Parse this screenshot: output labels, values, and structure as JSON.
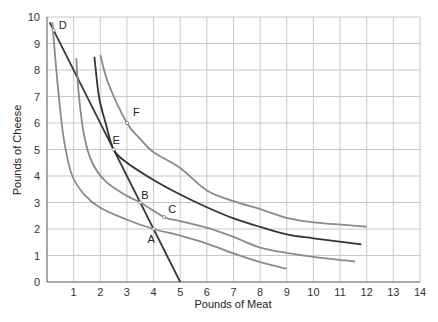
{
  "chart_data": {
    "type": "line",
    "title": "",
    "xlabel": "Pounds of Meat",
    "ylabel": "Pounds of Cheese",
    "xlim": [
      0,
      14
    ],
    "ylim": [
      0,
      10
    ],
    "x_ticks": [
      "1",
      "2",
      "3",
      "4",
      "5",
      "6",
      "7",
      "8",
      "9",
      "10",
      "11",
      "12",
      "13",
      "14"
    ],
    "y_ticks": [
      "0",
      "1",
      "2",
      "3",
      "4",
      "5",
      "6",
      "7",
      "8",
      "9",
      "10"
    ],
    "grid": true,
    "legend": null,
    "series": [
      {
        "name": "Budget line",
        "kind": "budget",
        "color": "#3a3a3a",
        "points": [
          [
            0.1,
            9.8
          ],
          [
            5,
            0
          ]
        ]
      },
      {
        "name": "Indifference curve 1",
        "kind": "indifference",
        "color": "#8a8a8a",
        "points": [
          [
            0.2,
            9.8
          ],
          [
            0.35,
            8
          ],
          [
            0.55,
            6
          ],
          [
            0.7,
            5
          ],
          [
            0.95,
            4
          ],
          [
            1.4,
            3.3
          ],
          [
            2,
            2.8
          ],
          [
            3,
            2.35
          ],
          [
            4,
            2
          ],
          [
            5,
            1.75
          ],
          [
            6,
            1.45
          ],
          [
            7,
            1.08
          ],
          [
            8,
            0.75
          ],
          [
            9,
            0.5
          ]
        ]
      },
      {
        "name": "Indifference curve 2",
        "kind": "indifference",
        "color": "#8a8a8a",
        "points": [
          [
            1.1,
            8.45
          ],
          [
            1.2,
            7
          ],
          [
            1.4,
            5.5
          ],
          [
            1.7,
            4.5
          ],
          [
            2.2,
            3.8
          ],
          [
            3,
            3.25
          ],
          [
            3.5,
            3
          ],
          [
            4.4,
            2.45
          ],
          [
            5,
            2.3
          ],
          [
            6,
            2.05
          ],
          [
            7,
            1.7
          ],
          [
            8,
            1.3
          ],
          [
            9,
            1.1
          ],
          [
            10,
            0.95
          ],
          [
            11.56,
            0.77
          ]
        ]
      },
      {
        "name": "Indifference curve 3",
        "kind": "indifference",
        "color": "#333333",
        "points": [
          [
            1.78,
            8.5
          ],
          [
            1.95,
            7
          ],
          [
            2.2,
            6
          ],
          [
            2.5,
            5
          ],
          [
            3,
            4.5
          ],
          [
            4,
            3.85
          ],
          [
            5,
            3.3
          ],
          [
            6,
            2.82
          ],
          [
            7,
            2.4
          ],
          [
            8,
            2.08
          ],
          [
            9,
            1.8
          ],
          [
            10,
            1.65
          ],
          [
            11.8,
            1.42
          ]
        ]
      },
      {
        "name": "Indifference curve 4",
        "kind": "indifference",
        "color": "#8a8a8a",
        "points": [
          [
            2.0,
            8.57
          ],
          [
            2.3,
            7.5
          ],
          [
            3,
            6
          ],
          [
            3.5,
            5.4
          ],
          [
            4,
            4.9
          ],
          [
            5,
            4.3
          ],
          [
            6,
            3.45
          ],
          [
            7,
            3.05
          ],
          [
            8,
            2.75
          ],
          [
            9,
            2.42
          ],
          [
            10,
            2.25
          ],
          [
            12,
            2.09
          ]
        ]
      }
    ],
    "annotations": [
      {
        "label": "A",
        "x": 4.0,
        "y": 2.0,
        "label_dx": -6,
        "label_dy": 14
      },
      {
        "label": "B",
        "x": 3.5,
        "y": 3.0,
        "label_dx": 1,
        "label_dy": -4
      },
      {
        "label": "C",
        "x": 4.4,
        "y": 2.45,
        "label_dx": 4,
        "label_dy": -4
      },
      {
        "label": "D",
        "x": 0.25,
        "y": 9.5,
        "label_dx": 5,
        "label_dy": -1
      },
      {
        "label": "E",
        "x": 2.5,
        "y": 5.0,
        "label_dx": -1,
        "label_dy": -6
      },
      {
        "label": "F",
        "x": 3.0,
        "y": 6.0,
        "label_dx": 6,
        "label_dy": -7
      }
    ]
  },
  "axes": {
    "xlabel": "Pounds of Meat",
    "ylabel": "Pounds of Cheese"
  }
}
